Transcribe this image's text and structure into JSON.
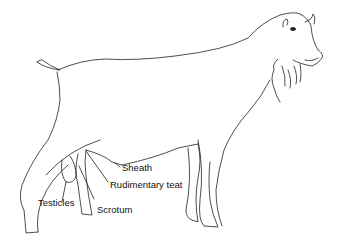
{
  "figure": {
    "labels": {
      "sheath": "Sheath",
      "rudimentary_teat": "Rudimentary teat",
      "testicles": "Testicles",
      "scrotum": "Scrotum"
    },
    "colors": {
      "line": "#222222",
      "background": "#ffffff"
    }
  }
}
